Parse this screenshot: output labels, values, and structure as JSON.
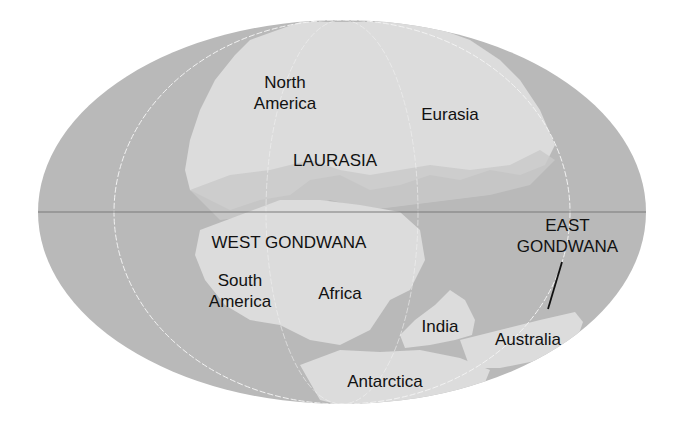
{
  "map": {
    "title": "Continents after breakup of Pangaea (Laurasia and Gondwana)",
    "colors": {
      "ocean": "#b9b9b9",
      "land": "#dcdcdc",
      "shelf": "#c9c9c9",
      "graticule": "#f2f2f2",
      "equator": "#7a7a7a",
      "text": "#111111"
    },
    "labels": {
      "north_america": "North\nAmerica",
      "eurasia": "Eurasia",
      "laurasia": "LAURASIA",
      "west_gondwana": "WEST GONDWANA",
      "south_america": "South\nAmerica",
      "africa": "Africa",
      "east_gondwana": "EAST\nGONDWANA",
      "india": "India",
      "australia": "Australia",
      "antarctica": "Antarctica"
    }
  }
}
